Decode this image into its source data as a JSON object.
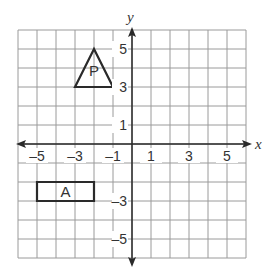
{
  "diagram": {
    "type": "coordinate-grid",
    "x_axis": {
      "label": "x",
      "min": -6,
      "max": 6,
      "tick_labels": [
        "-5",
        "-3",
        "-1",
        "1",
        "3",
        "5"
      ]
    },
    "y_axis": {
      "label": "y",
      "min": -6,
      "max": 6,
      "tick_labels": [
        "5",
        "3",
        "1",
        "-3",
        "-5"
      ]
    },
    "shapes": [
      {
        "name": "P",
        "type": "triangle",
        "vertices": [
          [
            -3,
            3
          ],
          [
            -2,
            5
          ],
          [
            -1,
            3
          ]
        ]
      },
      {
        "name": "A",
        "type": "rectangle",
        "vertices": [
          [
            -5,
            -2
          ],
          [
            -2,
            -2
          ],
          [
            -2,
            -3
          ],
          [
            -5,
            -3
          ]
        ]
      }
    ]
  }
}
